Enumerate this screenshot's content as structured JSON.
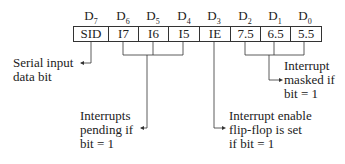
{
  "register": {
    "bit_labels": [
      {
        "main": "D",
        "sub": "7"
      },
      {
        "main": "D",
        "sub": "6"
      },
      {
        "main": "D",
        "sub": "5"
      },
      {
        "main": "D",
        "sub": "4"
      },
      {
        "main": "D",
        "sub": "3"
      },
      {
        "main": "D",
        "sub": "2"
      },
      {
        "main": "D",
        "sub": "1"
      },
      {
        "main": "D",
        "sub": "0"
      }
    ],
    "cells": [
      "SID",
      "I7",
      "I6",
      "I5",
      "IE",
      "7.5",
      "6.5",
      "5.5"
    ]
  },
  "annotations": {
    "sid": [
      "Serial input",
      "data bit"
    ],
    "pending": [
      "Interrupts",
      "pending if",
      "bit = 1"
    ],
    "enable": [
      "Interrupt enable",
      "flip-flop is set",
      "if bit = 1"
    ],
    "masked": [
      "Interrupt",
      "masked if",
      "bit = 1"
    ]
  }
}
